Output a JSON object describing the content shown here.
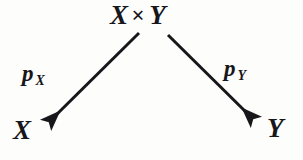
{
  "diagram": {
    "type": "commutative-diagram",
    "ink_color": "#17161a",
    "background_color": "#fdfdfc",
    "nodes": [
      {
        "id": "apex",
        "label": "X × Y",
        "factor_left": "X",
        "operator": "×",
        "factor_right": "Y",
        "position": "top-center"
      },
      {
        "id": "bottom-left",
        "label": "X",
        "position": "bottom-left"
      },
      {
        "id": "bottom-right",
        "label": "Y",
        "position": "bottom-right"
      }
    ],
    "arrows": [
      {
        "id": "projection-x",
        "from": "apex",
        "to": "bottom-left",
        "label_name": "p",
        "label_subscript": "X",
        "label_text": "p_X",
        "direction": "down-left",
        "head": "solid-triangle"
      },
      {
        "id": "projection-y",
        "from": "apex",
        "to": "bottom-right",
        "label_name": "p",
        "label_subscript": "Y",
        "label_text": "p_Y",
        "direction": "down-right",
        "head": "solid-triangle"
      }
    ]
  }
}
